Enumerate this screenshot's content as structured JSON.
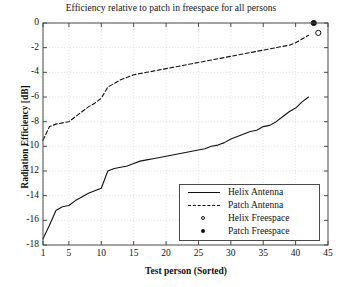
{
  "chart_data": {
    "type": "line",
    "title": "Efficiency relative to patch in freespace for all persons",
    "xlabel": "Test person (Sorted)",
    "ylabel": "Radiation Efficiency [dB]",
    "xlim": [
      1,
      45
    ],
    "ylim": [
      -18,
      0
    ],
    "xticks": [
      1,
      5,
      10,
      15,
      20,
      25,
      30,
      35,
      40,
      45
    ],
    "yticks": [
      0,
      -2,
      -4,
      -6,
      -8,
      -10,
      -12,
      -14,
      -16,
      -18
    ],
    "grid": true,
    "legend_position": "lower right",
    "series": [
      {
        "name": "Helix Antenna",
        "style": "solid",
        "x": [
          1,
          2,
          3,
          4,
          5,
          6,
          7,
          8,
          9,
          10,
          11,
          12,
          13,
          14,
          15,
          16,
          17,
          18,
          19,
          20,
          21,
          22,
          23,
          24,
          25,
          26,
          27,
          28,
          29,
          30,
          31,
          32,
          33,
          34,
          35,
          36,
          37,
          38,
          39,
          40,
          41,
          42
        ],
        "values": [
          -17.5,
          -16.4,
          -15.2,
          -14.9,
          -14.8,
          -14.4,
          -14.1,
          -13.8,
          -13.6,
          -13.4,
          -12.0,
          -11.8,
          -11.7,
          -11.6,
          -11.4,
          -11.2,
          -11.1,
          -11.0,
          -10.9,
          -10.8,
          -10.7,
          -10.6,
          -10.5,
          -10.4,
          -10.3,
          -10.2,
          -10.0,
          -9.9,
          -9.7,
          -9.4,
          -9.2,
          -9.0,
          -8.8,
          -8.7,
          -8.4,
          -8.3,
          -8.0,
          -7.6,
          -7.2,
          -6.9,
          -6.4,
          -6.0
        ]
      },
      {
        "name": "Patch Antenna",
        "style": "dashed",
        "x": [
          1,
          2,
          3,
          4,
          5,
          6,
          7,
          8,
          9,
          10,
          11,
          12,
          13,
          14,
          15,
          16,
          17,
          18,
          19,
          20,
          21,
          22,
          23,
          24,
          25,
          26,
          27,
          28,
          29,
          30,
          31,
          32,
          33,
          34,
          35,
          36,
          37,
          38,
          39,
          40,
          41,
          42
        ],
        "values": [
          -9.5,
          -8.4,
          -8.2,
          -8.1,
          -8.0,
          -7.6,
          -7.2,
          -6.8,
          -6.5,
          -6.1,
          -5.2,
          -4.9,
          -4.6,
          -4.4,
          -4.2,
          -4.1,
          -4.0,
          -3.9,
          -3.8,
          -3.7,
          -3.6,
          -3.5,
          -3.4,
          -3.3,
          -3.2,
          -3.1,
          -3.0,
          -2.9,
          -2.8,
          -2.7,
          -2.6,
          -2.5,
          -2.4,
          -2.3,
          -2.2,
          -2.1,
          -2.0,
          -1.9,
          -1.8,
          -1.6,
          -1.3,
          -1.0
        ]
      }
    ],
    "markers": [
      {
        "name": "Helix Freespace",
        "style": "open-circle",
        "x": 43.5,
        "y": -0.8
      },
      {
        "name": "Patch Freespace",
        "style": "filled-circle",
        "x": 42.8,
        "y": 0.0
      }
    ],
    "legend": [
      {
        "label": "Helix Antenna",
        "style": "solid"
      },
      {
        "label": "Patch Antenna",
        "style": "dashed"
      },
      {
        "label": "Helix Freespace",
        "style": "open-circle"
      },
      {
        "label": "Patch Freespace",
        "style": "filled-circle"
      }
    ],
    "colors": {
      "line": "#111111",
      "axis": "#4a4a4a",
      "grid": "#d8d8d8",
      "background": "#ffffff"
    }
  }
}
